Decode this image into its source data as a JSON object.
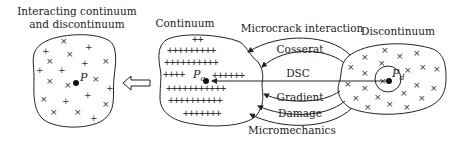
{
  "left": {
    "title_line1": "Interacting continuum",
    "title_line2": "and discontinuum",
    "point_label": "P"
  },
  "middle": {
    "title": "Continuum",
    "point_label": "P",
    "point_subscript": "c",
    "plus_rows": [
      "++",
      "+++++++++",
      "++++++++++",
      "++++",
      "++++++",
      "+++++++++++",
      "++++++++++",
      "+++++++"
    ]
  },
  "right": {
    "title": "Discontinuum",
    "point_label": "P",
    "point_subscript": "d"
  },
  "theories": [
    {
      "label": "Microcrack interaction"
    },
    {
      "label": "Cosserat"
    },
    {
      "label": "DSC"
    },
    {
      "label": "Gradient"
    },
    {
      "label": "Damage"
    },
    {
      "label": "Micromechanics"
    }
  ]
}
